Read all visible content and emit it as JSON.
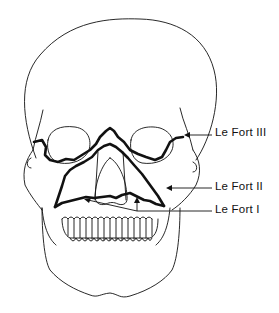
{
  "figure": {
    "labels": [
      {
        "id": "le-fort-3",
        "text": "Le Fort III",
        "x": 215,
        "y": 125
      },
      {
        "id": "le-fort-2",
        "text": "Le Fort II",
        "x": 215,
        "y": 179
      },
      {
        "id": "le-fort-1",
        "text": "Le Fort I",
        "x": 215,
        "y": 202
      }
    ],
    "colors": {
      "line": "#111111",
      "background": "#ffffff"
    }
  }
}
